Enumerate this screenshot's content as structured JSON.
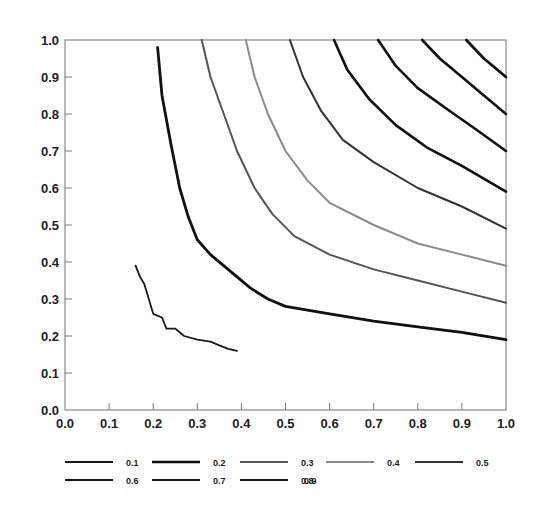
{
  "chart_data": {
    "type": "line",
    "title": "",
    "xlabel": "",
    "ylabel": "",
    "xlim": [
      0.0,
      1.0
    ],
    "ylim": [
      0.0,
      1.0
    ],
    "grid": false,
    "legend_position": "bottom",
    "x_ticks": [
      "0.0",
      "0.1",
      "0.2",
      "0.3",
      "0.4",
      "0.5",
      "0.6",
      "0.7",
      "0.8",
      "0.9",
      "1.0"
    ],
    "y_ticks": [
      "0.0",
      "0.1",
      "0.2",
      "0.3",
      "0.4",
      "0.5",
      "0.6",
      "0.7",
      "0.8",
      "0.9",
      "1.0"
    ],
    "series": [
      {
        "name": "0.1",
        "color": "#1a1a1a",
        "width": 1.8,
        "points": [
          [
            0.16,
            0.39
          ],
          [
            0.17,
            0.36
          ],
          [
            0.18,
            0.34
          ],
          [
            0.2,
            0.26
          ],
          [
            0.22,
            0.25
          ],
          [
            0.23,
            0.22
          ],
          [
            0.25,
            0.22
          ],
          [
            0.27,
            0.2
          ],
          [
            0.3,
            0.19
          ],
          [
            0.33,
            0.185
          ],
          [
            0.35,
            0.175
          ],
          [
            0.37,
            0.165
          ],
          [
            0.39,
            0.16
          ]
        ]
      },
      {
        "name": "0.2",
        "color": "#111111",
        "width": 2.8,
        "points": [
          [
            0.21,
            0.98
          ],
          [
            0.22,
            0.85
          ],
          [
            0.24,
            0.72
          ],
          [
            0.26,
            0.6
          ],
          [
            0.28,
            0.52
          ],
          [
            0.3,
            0.46
          ],
          [
            0.33,
            0.42
          ],
          [
            0.38,
            0.37
          ],
          [
            0.42,
            0.33
          ],
          [
            0.46,
            0.3
          ],
          [
            0.5,
            0.28
          ],
          [
            0.6,
            0.26
          ],
          [
            0.7,
            0.24
          ],
          [
            0.8,
            0.225
          ],
          [
            0.9,
            0.21
          ],
          [
            1.0,
            0.19
          ]
        ]
      },
      {
        "name": "0.3",
        "color": "#555555",
        "width": 2.0,
        "points": [
          [
            0.31,
            1.0
          ],
          [
            0.33,
            0.9
          ],
          [
            0.36,
            0.8
          ],
          [
            0.39,
            0.7
          ],
          [
            0.43,
            0.6
          ],
          [
            0.47,
            0.53
          ],
          [
            0.52,
            0.47
          ],
          [
            0.6,
            0.42
          ],
          [
            0.7,
            0.38
          ],
          [
            0.8,
            0.35
          ],
          [
            0.9,
            0.32
          ],
          [
            1.0,
            0.29
          ]
        ]
      },
      {
        "name": "0.4",
        "color": "#8a8a8a",
        "width": 2.0,
        "points": [
          [
            0.41,
            1.0
          ],
          [
            0.43,
            0.9
          ],
          [
            0.46,
            0.8
          ],
          [
            0.5,
            0.7
          ],
          [
            0.55,
            0.62
          ],
          [
            0.6,
            0.56
          ],
          [
            0.7,
            0.5
          ],
          [
            0.8,
            0.45
          ],
          [
            0.9,
            0.42
          ],
          [
            1.0,
            0.39
          ]
        ]
      },
      {
        "name": "0.5",
        "color": "#333333",
        "width": 2.0,
        "points": [
          [
            0.51,
            1.0
          ],
          [
            0.54,
            0.9
          ],
          [
            0.58,
            0.81
          ],
          [
            0.63,
            0.73
          ],
          [
            0.7,
            0.67
          ],
          [
            0.8,
            0.6
          ],
          [
            0.9,
            0.55
          ],
          [
            1.0,
            0.49
          ]
        ]
      },
      {
        "name": "0.6",
        "color": "#111111",
        "width": 2.6,
        "points": [
          [
            0.61,
            1.0
          ],
          [
            0.64,
            0.92
          ],
          [
            0.69,
            0.84
          ],
          [
            0.75,
            0.77
          ],
          [
            0.82,
            0.71
          ],
          [
            0.9,
            0.66
          ],
          [
            1.0,
            0.59
          ]
        ]
      },
      {
        "name": "0.7",
        "color": "#111111",
        "width": 2.6,
        "points": [
          [
            0.71,
            1.0
          ],
          [
            0.75,
            0.93
          ],
          [
            0.8,
            0.87
          ],
          [
            0.87,
            0.81
          ],
          [
            0.93,
            0.76
          ],
          [
            1.0,
            0.7
          ]
        ]
      },
      {
        "name": "0.8",
        "color": "#111111",
        "width": 2.6,
        "points": [
          [
            0.81,
            1.0
          ],
          [
            0.85,
            0.95
          ],
          [
            0.9,
            0.9
          ],
          [
            0.95,
            0.85
          ],
          [
            1.0,
            0.8
          ]
        ]
      },
      {
        "name": "0.9",
        "color": "#111111",
        "width": 2.8,
        "points": [
          [
            0.91,
            1.0
          ],
          [
            0.95,
            0.95
          ],
          [
            1.0,
            0.9
          ]
        ]
      }
    ]
  },
  "legend": {
    "items": [
      {
        "label": "0.1"
      },
      {
        "label": "0.2"
      },
      {
        "label": "0.3"
      },
      {
        "label": "0.4"
      },
      {
        "label": "0.5"
      },
      {
        "label": "0.6"
      },
      {
        "label": "0.7"
      },
      {
        "label": "0.8"
      },
      {
        "label": "0.9"
      }
    ]
  }
}
